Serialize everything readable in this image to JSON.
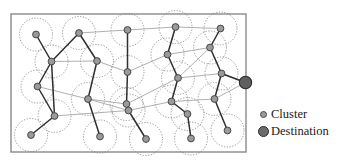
{
  "figure": {
    "frame": {
      "x": 11,
      "y": 14,
      "width": 235,
      "height": 138,
      "stroke": "#8a8a8a",
      "stroke_width": 1.4,
      "fill": "#ffffff"
    },
    "style": {
      "cluster_fill": "#9a9a9a",
      "cluster_stroke": "#3c3c3c",
      "cluster_radius": 3.4,
      "halo_stroke": "#7a7a7a",
      "halo_radius": 16.5,
      "halo_dash": "1.2 1.6",
      "edge_dark": "#2f2f2f",
      "edge_light": "#9b9b9b",
      "destination_fill": "#5f5f5f",
      "destination_stroke": "#2a2a2a",
      "destination_radius": 6.2
    },
    "nodes": [
      {
        "id": "n1",
        "label": "cluster",
        "x": 36,
        "y": 34.5,
        "halo": true
      },
      {
        "id": "n2",
        "label": "cluster",
        "x": 79,
        "y": 33,
        "halo": true
      },
      {
        "id": "n3",
        "label": "cluster",
        "x": 127.5,
        "y": 30,
        "halo": true
      },
      {
        "id": "n4",
        "label": "cluster",
        "x": 175.5,
        "y": 27,
        "halo": true
      },
      {
        "id": "n5",
        "label": "cluster",
        "x": 220.5,
        "y": 28.5,
        "halo": true
      },
      {
        "id": "n6",
        "label": "cluster",
        "x": 51.5,
        "y": 61.5,
        "halo": true
      },
      {
        "id": "n7",
        "label": "cluster",
        "x": 97,
        "y": 61,
        "halo": true
      },
      {
        "id": "n8",
        "label": "cluster",
        "x": 127.5,
        "y": 72,
        "halo": true
      },
      {
        "id": "n9",
        "label": "cluster",
        "x": 167.5,
        "y": 54.5,
        "halo": true
      },
      {
        "id": "n10",
        "label": "cluster",
        "x": 210,
        "y": 47.5,
        "halo": true
      },
      {
        "id": "n11",
        "label": "cluster",
        "x": 37.5,
        "y": 86.5,
        "halo": true
      },
      {
        "id": "n12",
        "label": "cluster",
        "x": 88,
        "y": 99,
        "halo": true
      },
      {
        "id": "n13",
        "label": "cluster",
        "x": 126.5,
        "y": 104,
        "halo": true
      },
      {
        "id": "n14",
        "label": "cluster",
        "x": 178,
        "y": 78,
        "halo": true
      },
      {
        "id": "n15",
        "label": "cluster",
        "x": 221.5,
        "y": 73.5,
        "halo": true
      },
      {
        "id": "n16",
        "label": "cluster",
        "x": 54.5,
        "y": 116,
        "halo": true
      },
      {
        "id": "n17",
        "label": "cluster",
        "x": 128.5,
        "y": 110.5,
        "halo": true
      },
      {
        "id": "n18",
        "label": "cluster",
        "x": 171.5,
        "y": 101.5,
        "halo": true
      },
      {
        "id": "n19",
        "label": "cluster",
        "x": 214.5,
        "y": 99,
        "halo": true
      },
      {
        "id": "n20",
        "label": "cluster",
        "x": 31,
        "y": 135,
        "halo": true
      },
      {
        "id": "n21",
        "label": "cluster",
        "x": 100,
        "y": 136.5,
        "halo": true
      },
      {
        "id": "n22",
        "label": "cluster",
        "x": 146,
        "y": 139,
        "halo": true
      },
      {
        "id": "n23",
        "label": "cluster",
        "x": 187.5,
        "y": 114,
        "halo": true
      },
      {
        "id": "n24",
        "label": "cluster",
        "x": 191,
        "y": 138.5,
        "halo": true
      },
      {
        "id": "n25",
        "label": "cluster",
        "x": 227.5,
        "y": 130.5,
        "halo": true
      },
      {
        "id": "d1",
        "label": "destination",
        "x": 245.5,
        "y": 82.5,
        "halo": false
      }
    ],
    "edges_dark": [
      [
        "n1",
        "n6"
      ],
      [
        "n2",
        "n6"
      ],
      [
        "n2",
        "n7"
      ],
      [
        "n6",
        "n11"
      ],
      [
        "n6",
        "n16"
      ],
      [
        "n11",
        "n16"
      ],
      [
        "n16",
        "n20"
      ],
      [
        "n7",
        "n12"
      ],
      [
        "n12",
        "n21"
      ],
      [
        "n3",
        "n8"
      ],
      [
        "n8",
        "n13"
      ],
      [
        "n13",
        "n17"
      ],
      [
        "n17",
        "n22"
      ],
      [
        "n4",
        "n9"
      ],
      [
        "n9",
        "n14"
      ],
      [
        "n14",
        "n18"
      ],
      [
        "n18",
        "n23"
      ],
      [
        "n23",
        "n24"
      ],
      [
        "n5",
        "n10"
      ],
      [
        "n10",
        "n15"
      ],
      [
        "n15",
        "n19"
      ],
      [
        "n19",
        "n25"
      ],
      [
        "n15",
        "d1"
      ]
    ],
    "edges_light": [
      [
        "n2",
        "n3"
      ],
      [
        "n3",
        "n4"
      ],
      [
        "n4",
        "n5"
      ],
      [
        "n6",
        "n7"
      ],
      [
        "n7",
        "n8"
      ],
      [
        "n8",
        "n9"
      ],
      [
        "n9",
        "n10"
      ],
      [
        "n11",
        "n12"
      ],
      [
        "n12",
        "n13"
      ],
      [
        "n13",
        "n14"
      ],
      [
        "n14",
        "n15"
      ],
      [
        "n16",
        "n17"
      ],
      [
        "n17",
        "n18"
      ],
      [
        "n18",
        "n19"
      ],
      [
        "n10",
        "n14"
      ],
      [
        "n15",
        "d1"
      ],
      [
        "n19",
        "d1"
      ],
      [
        "n12",
        "n17"
      ]
    ]
  },
  "legend": {
    "items": [
      {
        "key": "cluster",
        "label": "Cluster",
        "marker": "small-gray-dot"
      },
      {
        "key": "destination",
        "label": "Destination",
        "marker": "large-dark-dot"
      }
    ]
  }
}
